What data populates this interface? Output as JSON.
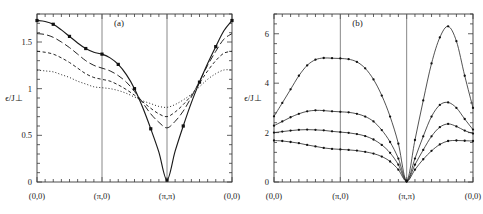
{
  "figure": {
    "type": "scientific-figure",
    "background": "#ffffff",
    "ink_color": "#1a1a1a",
    "guide_color": "#6a6a6a"
  },
  "chart_data": [
    {
      "type": "line",
      "panel_label": "(a)",
      "title": "",
      "xlabel": "",
      "ylabel": "ϵ/J⊥",
      "ylabel_plain": "epsilon / J_perp",
      "xlim": [
        0,
        3
      ],
      "ylim": [
        0,
        1.8
      ],
      "yticks": [
        0,
        0.5,
        1,
        1.5
      ],
      "ytick_labels": [
        "0",
        "0.5",
        "1",
        "1.5"
      ],
      "xticks": [
        0,
        1,
        2,
        3
      ],
      "xtick_labels": [
        "(0,0)",
        "(π,0)",
        "(π,π)",
        "(0,0)"
      ],
      "grid": false,
      "vertical_guides": [
        1,
        2
      ],
      "legend": "none",
      "x": [
        0,
        0.125,
        0.25,
        0.375,
        0.5,
        0.625,
        0.75,
        0.875,
        1,
        1.125,
        1.25,
        1.375,
        1.5,
        1.625,
        1.75,
        1.875,
        2,
        2.125,
        2.25,
        2.375,
        2.5,
        2.625,
        2.75,
        2.875,
        3
      ],
      "series": [
        {
          "name": "curve-1",
          "style": "solid",
          "markers": "square",
          "values": [
            1.73,
            1.72,
            1.69,
            1.63,
            1.56,
            1.49,
            1.43,
            1.39,
            1.37,
            1.33,
            1.26,
            1.15,
            1.0,
            0.8,
            0.57,
            0.32,
            0.02,
            0.33,
            0.6,
            0.85,
            1.07,
            1.27,
            1.45,
            1.62,
            1.73
          ]
        },
        {
          "name": "curve-2",
          "style": "long-dash",
          "markers": "none",
          "values": [
            1.59,
            1.58,
            1.55,
            1.5,
            1.44,
            1.37,
            1.3,
            1.25,
            1.22,
            1.19,
            1.14,
            1.07,
            0.97,
            0.85,
            0.73,
            0.64,
            0.58,
            0.65,
            0.76,
            0.91,
            1.08,
            1.25,
            1.4,
            1.53,
            1.59
          ]
        },
        {
          "name": "curve-3",
          "style": "short-dash",
          "markers": "none",
          "values": [
            1.4,
            1.39,
            1.37,
            1.33,
            1.28,
            1.22,
            1.16,
            1.12,
            1.1,
            1.08,
            1.04,
            0.99,
            0.93,
            0.86,
            0.79,
            0.73,
            0.7,
            0.75,
            0.83,
            0.93,
            1.06,
            1.19,
            1.3,
            1.38,
            1.4
          ]
        },
        {
          "name": "curve-4",
          "style": "dotted",
          "markers": "none",
          "values": [
            1.2,
            1.19,
            1.18,
            1.15,
            1.12,
            1.08,
            1.05,
            1.02,
            1.01,
            1.0,
            0.98,
            0.95,
            0.91,
            0.87,
            0.84,
            0.81,
            0.8,
            0.83,
            0.88,
            0.94,
            1.02,
            1.1,
            1.16,
            1.2,
            1.2
          ]
        }
      ]
    },
    {
      "type": "line",
      "panel_label": "(b)",
      "title": "",
      "xlabel": "",
      "ylabel": "ϵ/J⊥",
      "ylabel_plain": "epsilon / J_perp",
      "xlim": [
        0,
        3
      ],
      "ylim": [
        0,
        6.8
      ],
      "yticks": [
        0,
        2,
        4,
        6
      ],
      "ytick_labels": [
        "0",
        "2",
        "4",
        "6"
      ],
      "xticks": [
        0,
        1,
        2,
        3
      ],
      "xtick_labels": [
        "(0,0)",
        "(π,0)",
        "(π,π)",
        "(0,0)"
      ],
      "grid": false,
      "vertical_guides": [
        1,
        2
      ],
      "legend": "none",
      "x": [
        0,
        0.125,
        0.25,
        0.375,
        0.5,
        0.625,
        0.75,
        0.875,
        1,
        1.125,
        1.25,
        1.375,
        1.5,
        1.625,
        1.75,
        1.875,
        2,
        2.125,
        2.25,
        2.375,
        2.5,
        2.625,
        2.75,
        2.875,
        3
      ],
      "series": [
        {
          "name": "curve-1",
          "style": "solid-thin",
          "markers": "dot",
          "values": [
            2.66,
            3.2,
            3.75,
            4.3,
            4.72,
            4.95,
            5.02,
            5.01,
            5.0,
            4.97,
            4.86,
            4.6,
            4.15,
            3.5,
            2.65,
            1.55,
            0.05,
            1.7,
            3.3,
            4.8,
            5.85,
            6.3,
            5.7,
            4.3,
            3.0
          ]
        },
        {
          "name": "curve-2",
          "style": "solid-thin",
          "markers": "dot",
          "values": [
            2.28,
            2.45,
            2.62,
            2.76,
            2.86,
            2.9,
            2.89,
            2.86,
            2.84,
            2.82,
            2.76,
            2.65,
            2.45,
            2.1,
            1.62,
            0.95,
            0.04,
            0.95,
            1.85,
            2.65,
            3.12,
            3.22,
            3.0,
            2.55,
            2.12
          ]
        },
        {
          "name": "curve-3",
          "style": "solid-thin",
          "markers": "dot",
          "values": [
            2.0,
            2.04,
            2.08,
            2.11,
            2.12,
            2.11,
            2.09,
            2.05,
            2.02,
            1.99,
            1.94,
            1.86,
            1.72,
            1.5,
            1.18,
            0.7,
            0.03,
            0.7,
            1.3,
            1.85,
            2.22,
            2.35,
            2.25,
            2.08,
            1.96
          ]
        },
        {
          "name": "curve-4",
          "style": "solid-thin",
          "markers": "dot",
          "values": [
            1.68,
            1.66,
            1.62,
            1.57,
            1.5,
            1.44,
            1.38,
            1.34,
            1.32,
            1.3,
            1.27,
            1.22,
            1.15,
            1.03,
            0.83,
            0.5,
            0.02,
            0.5,
            0.92,
            1.26,
            1.52,
            1.66,
            1.68,
            1.67,
            1.66
          ]
        }
      ]
    }
  ]
}
